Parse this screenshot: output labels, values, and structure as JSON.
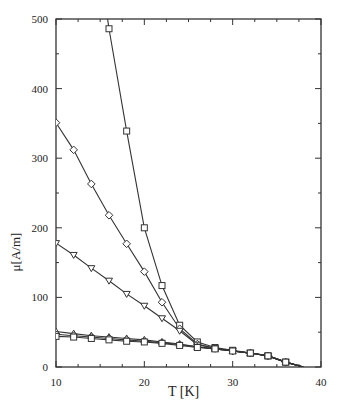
{
  "chart_data": {
    "type": "line",
    "title": "",
    "xlabel": "T [K]",
    "ylabel": "μ[A/m]",
    "xlim": [
      10,
      40
    ],
    "ylim": [
      0,
      500
    ],
    "xticks": [
      10,
      20,
      30,
      40
    ],
    "yticks": [
      0,
      100,
      200,
      300,
      400,
      500
    ],
    "grid": false,
    "legend": "none",
    "series": [
      {
        "name": "squares (open)",
        "marker": "square",
        "x": [
          16,
          18,
          20,
          22,
          24,
          26,
          28,
          30,
          32,
          34,
          36,
          38
        ],
        "y": [
          486,
          339,
          200,
          117,
          60,
          36,
          28,
          24,
          20,
          16,
          7,
          0
        ]
      },
      {
        "name": "diamonds (open)",
        "marker": "diamond",
        "x": [
          10,
          12,
          14,
          16,
          18,
          20,
          22,
          24,
          26,
          28,
          30,
          32,
          34,
          36,
          38
        ],
        "y": [
          351,
          312,
          263,
          218,
          177,
          137,
          93,
          55,
          33,
          27,
          23,
          20,
          16,
          7,
          0
        ]
      },
      {
        "name": "triangles down (open)",
        "marker": "triangle-down",
        "x": [
          10,
          12,
          14,
          16,
          18,
          20,
          22,
          24,
          26,
          28,
          30,
          32,
          34,
          36,
          38
        ],
        "y": [
          178,
          161,
          142,
          124,
          105,
          88,
          70,
          52,
          32,
          27,
          23,
          20,
          16,
          7,
          0
        ]
      },
      {
        "name": "triangles up (open)",
        "marker": "triangle-up",
        "x": [
          10,
          12,
          14,
          16,
          18,
          20,
          22,
          24,
          26,
          28,
          30,
          32,
          34,
          36,
          38
        ],
        "y": [
          51,
          48,
          45,
          43,
          41,
          39,
          36,
          33,
          29,
          26,
          23,
          20,
          16,
          7,
          0
        ]
      },
      {
        "name": "circles (open)",
        "marker": "circle",
        "x": [
          10,
          12,
          14,
          16,
          18,
          20,
          22,
          24,
          26,
          28,
          30,
          32,
          34,
          36,
          38
        ],
        "y": [
          47,
          45,
          43,
          41,
          39,
          37,
          35,
          32,
          29,
          26,
          23,
          20,
          16,
          7,
          0
        ]
      },
      {
        "name": "squares bundle (open)",
        "marker": "square",
        "x": [
          10,
          12,
          14,
          16,
          18,
          20,
          22,
          24,
          26,
          28,
          30,
          32,
          34,
          36,
          38
        ],
        "y": [
          44,
          43,
          41,
          39,
          37,
          36,
          34,
          31,
          28,
          26,
          23,
          20,
          16,
          7,
          0
        ]
      }
    ]
  },
  "axes": {
    "x_title": "T [K]",
    "y_title": "μ[A/m]"
  }
}
